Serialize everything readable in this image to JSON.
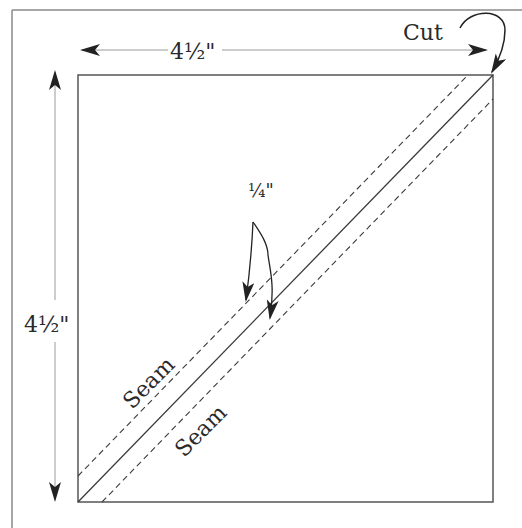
{
  "diagram": {
    "colors": {
      "line": "#3a3a3a",
      "frame": "#8a8a8a",
      "dim_line": "#9a9a9a",
      "arrow": "#222222",
      "text": "#2a2a2a"
    },
    "labels": {
      "width_dimension": "4½\"",
      "height_dimension": "4½\"",
      "cut": "Cut",
      "seam_allowance": "¼\"",
      "seam_upper": "Seam",
      "seam_lower": "Seam"
    },
    "square": {
      "x": 78,
      "y": 75,
      "size": 415
    }
  }
}
